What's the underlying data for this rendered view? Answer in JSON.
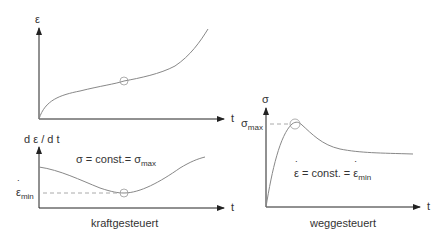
{
  "left_panel": {
    "caption": "kraftgesteuert",
    "top_plot": {
      "y_label": "ε",
      "x_label": "t"
    },
    "bottom_plot": {
      "y_label": "d ε / d t",
      "x_label": "t",
      "annotation_main": "σ = const.= σ",
      "annotation_sub": "max",
      "min_label_main": "ε",
      "min_label_sub": "min"
    }
  },
  "right_panel": {
    "caption": "weggesteuert",
    "y_label": "σ",
    "x_label": "t",
    "max_label_main": "σ",
    "max_label_sub": "max",
    "annotation_part1": "ε",
    "annotation_part2": " = const. = ",
    "annotation_part3": "ε",
    "annotation_sub": "min"
  },
  "colors": {
    "axis": "#222222",
    "curve": "#888888",
    "dashed": "#aaaaaa",
    "text": "#333333"
  }
}
